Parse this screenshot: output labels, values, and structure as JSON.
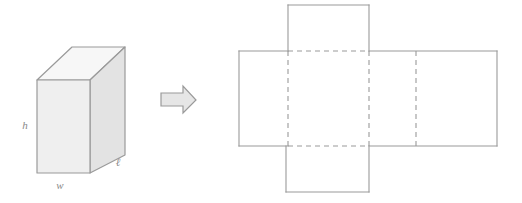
{
  "figure": {
    "background_color": "#ffffff",
    "stroke_color": "#9a9a9a",
    "label_color": "#8a8a8a"
  },
  "prism": {
    "name": "rectangular-prism",
    "labels": {
      "height": "h",
      "width": "w",
      "length": "ℓ"
    },
    "faces": {
      "front": {
        "name": "front-face",
        "fill": "#efefef"
      },
      "top": {
        "name": "top-face",
        "fill": "#f7f7f7"
      },
      "side": {
        "name": "right-side-face",
        "fill": "#e3e3e3"
      }
    },
    "geometry": {
      "front": "37,80 90,80 90,173 37,173",
      "top": "37,80 72,47 125,47 90,80",
      "side": "90,80 125,47 125,155 90,173"
    },
    "label_positions": {
      "height": {
        "x": 25,
        "y": 129
      },
      "width": {
        "x": 54,
        "y": 188
      },
      "length": {
        "x": 116,
        "y": 165
      }
    }
  },
  "arrow": {
    "name": "right-arrow",
    "fill": "#e6e6e6",
    "points": "161,93 183,93 183,86 196,100 183,113 183,106 161,106"
  },
  "net": {
    "name": "box-net",
    "fill": "#ffffff",
    "solid_edges": [
      "288,5 369,5",
      "288,5 288,51",
      "369,5 369,51",
      "239,51 288,51",
      "369,51 497,51",
      "239,51 239,146",
      "497,51 497,146",
      "239,146 288,146",
      "369,146 497,146",
      "286,146 286,192",
      "286,192 369,192",
      "369,146 369,192"
    ],
    "dashed_edges": [
      "288,51 369,51",
      "288,146 369,146",
      "288,51 288,146",
      "369,51 369,146",
      "416,51 416,146"
    ],
    "panels": [
      {
        "name": "net-panel-top-flap",
        "role": "top"
      },
      {
        "name": "net-panel-left",
        "role": "left-side"
      },
      {
        "name": "net-panel-center",
        "role": "front"
      },
      {
        "name": "net-panel-right",
        "role": "back-and-right"
      },
      {
        "name": "net-panel-bottom-flap",
        "role": "bottom"
      }
    ]
  }
}
